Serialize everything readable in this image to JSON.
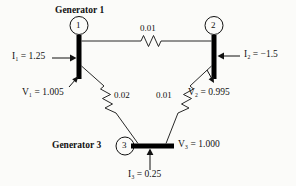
{
  "diagram": {
    "background_color": "#fbfbf9",
    "line_color": "#111111",
    "bus_color": "#000000",
    "nodes": [
      {
        "id": "1",
        "label": "1",
        "bus_name": "bus-1",
        "generator_label": "Generator 1"
      },
      {
        "id": "2",
        "label": "2",
        "bus_name": "bus-2",
        "generator_label": ""
      },
      {
        "id": "3",
        "label": "3",
        "bus_name": "bus-3",
        "generator_label": "Generator 3"
      }
    ],
    "generators": {
      "gen1_label": "Generator 1",
      "gen3_label": "Generator 3"
    },
    "node_labels": {
      "n1": "1",
      "n2": "2",
      "n3": "3"
    },
    "branches": [
      {
        "name": "line-1-2",
        "from": "1",
        "to": "2",
        "resistance": "0.01"
      },
      {
        "name": "line-1-3",
        "from": "1",
        "to": "3",
        "resistance": "0.02"
      },
      {
        "name": "line-2-3",
        "from": "2",
        "to": "3",
        "resistance": "0.01"
      }
    ],
    "branch_labels": {
      "r12": "0.01",
      "r13": "0.02",
      "r23": "0.01"
    },
    "currents": {
      "i1": {
        "symbol": "I",
        "subscript": "1",
        "equals": "=",
        "value": "1.25",
        "text": "I₁ = 1.25",
        "direction": "right"
      },
      "i2": {
        "symbol": "I",
        "subscript": "2",
        "equals": "=",
        "value": "−1.5",
        "text": "I₂ = −1.5",
        "direction": "left"
      },
      "i3": {
        "symbol": "I",
        "subscript": "3",
        "equals": "=",
        "value": "0.25",
        "text": "I₃ = 0.25",
        "direction": "up"
      }
    },
    "voltages": {
      "v1": {
        "symbol": "V",
        "subscript": "1",
        "equals": "=",
        "value": "1.005",
        "text": "V₁ = 1.005"
      },
      "v2": {
        "symbol": "V",
        "subscript": "2",
        "equals": "=",
        "value": "0.995",
        "text": "V₂ = 0.995"
      },
      "v3": {
        "symbol": "V",
        "subscript": "3",
        "equals": "=",
        "value": "1.000",
        "text": "V₃ = 1.000"
      }
    },
    "symbols": {
      "i_symbol": "I",
      "v_symbol": "V",
      "equals": "="
    }
  }
}
